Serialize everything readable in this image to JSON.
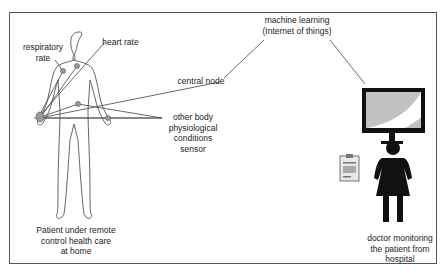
{
  "diagram": {
    "labels": {
      "respiratory_rate": "respiratory rate",
      "heart_rate": "heart rate",
      "central_node": "central node",
      "other_sensor": "other body physiological conditions sensor",
      "machine_learning_1": "machine learning",
      "machine_learning_2": "(Internet of things)",
      "patient_1": "Patient under remote",
      "patient_2": "control health care",
      "patient_3": "at home",
      "doctor_1": "doctor monitoring",
      "doctor_2": "the patient from",
      "doctor_3": "hospital",
      "resp_1": "respiratory",
      "resp_2": "rate",
      "other_1": "other body",
      "other_2": "physiological",
      "other_3": "conditions",
      "other_4": "sensor"
    },
    "nodes": [
      "patient",
      "respiratory rate sensor",
      "heart rate sensor",
      "central node",
      "other body sensor",
      "machine learning (IoT)",
      "monitor",
      "doctor"
    ],
    "colors": {
      "line": "#444444",
      "figure": "#111111",
      "screen": "#bdbdbd"
    }
  }
}
